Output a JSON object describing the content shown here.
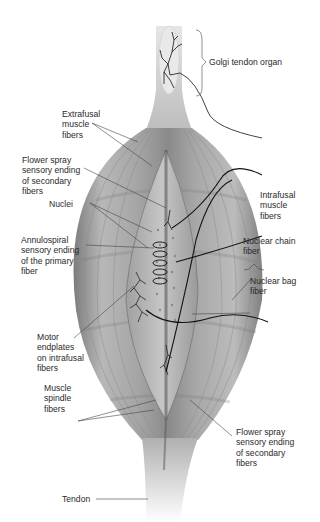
{
  "figure": {
    "labels": {
      "golgi_tendon_organ": "Golgi tendon organ",
      "extrafusal_muscle_fibers": "Extrafusal\nmuscle\nfibers",
      "flower_spray_top": "Flower spray\nsensory ending\nof secondary\nfibers",
      "nuclei": "Nuclei",
      "annulospiral": "Annulospiral\nsensory ending\nof the primary\nfiber",
      "intrafusal_muscle_fibers": "Intrafusal\nmuscle\nfibers",
      "nuclear_chain_fiber": "Nuclear chain\nfiber",
      "nuclear_bag_fiber": "Nuclear bag\nfiber",
      "motor_endplates": "Motor\nendplates\non intrafusal\nfibers",
      "muscle_spindle_fibers": "Muscle\nspindle\nfibers",
      "flower_spray_bottom": "Flower spray\nsensory ending\nof secondary\nfibers",
      "tendon": "Tendon"
    },
    "colors": {
      "muscle_light": "#c9c9c9",
      "muscle_mid": "#9a9a9a",
      "muscle_dark": "#6e6e6e",
      "nerve": "#111111",
      "leader": "#444444"
    }
  }
}
